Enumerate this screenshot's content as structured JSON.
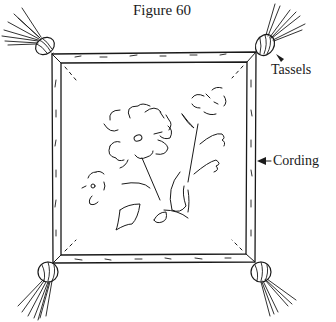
{
  "figure": {
    "title": "Figure 60",
    "labels": {
      "tassels": "Tassels",
      "cording": "Cording"
    },
    "colors": {
      "ink": "#1a1a1a",
      "background": "#ffffff"
    },
    "parts": [
      {
        "name": "pillow-frame",
        "description": "square pillow outline with double-line corded border"
      },
      {
        "name": "tassel-top-left"
      },
      {
        "name": "tassel-top-right"
      },
      {
        "name": "tassel-bottom-left"
      },
      {
        "name": "tassel-bottom-right"
      },
      {
        "name": "large-flower"
      },
      {
        "name": "small-flower-top-right"
      },
      {
        "name": "small-flower-left"
      },
      {
        "name": "leaves-and-stems"
      }
    ]
  }
}
